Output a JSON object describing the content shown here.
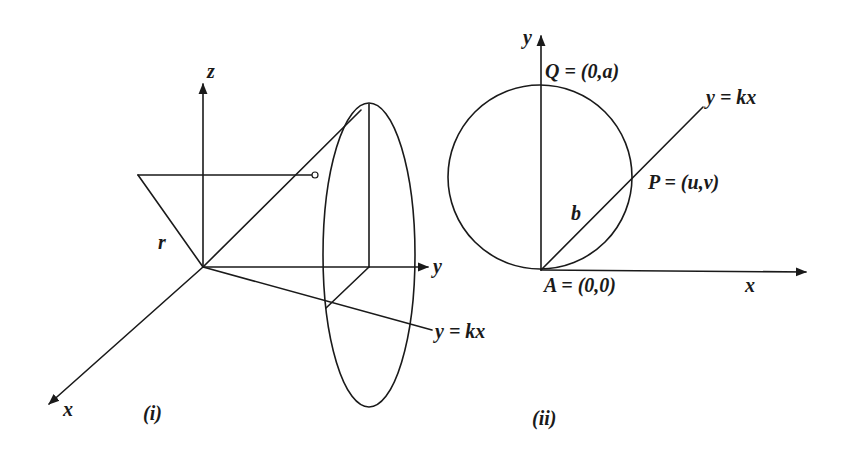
{
  "figure_i": {
    "caption": "(i)",
    "axis_labels": {
      "x": "x",
      "y": "y",
      "z": "z"
    },
    "line_label": "y = kx",
    "radius_label": "r"
  },
  "figure_ii": {
    "caption": "(ii)",
    "axis_labels": {
      "x": "x",
      "y": "y"
    },
    "line_label": "y = kx",
    "point_Q": "Q = (0,a)",
    "point_P": "P = (u,v)",
    "point_A": "A = (0,0)",
    "chord_label": "b"
  },
  "colors": {
    "stroke": "#1a1a1a",
    "background": "#ffffff"
  }
}
